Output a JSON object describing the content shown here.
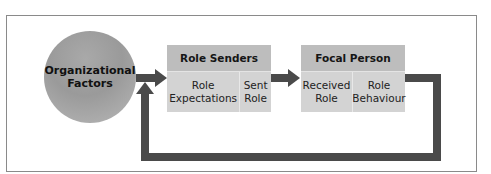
{
  "diagram": {
    "circle": {
      "label": "Organizational\nFactors",
      "color": "#a0a0a0"
    },
    "role_senders": {
      "title": "Role Senders",
      "cells": [
        {
          "label": "Role\nExpectations"
        },
        {
          "label": "Sent\nRole"
        }
      ]
    },
    "focal_person": {
      "title": "Focal Person",
      "cells": [
        {
          "label": "Received\nRole"
        },
        {
          "label": "Role\nBehaviour"
        }
      ]
    },
    "colors": {
      "arrow": "#4a4a4a",
      "header": "#bdbdbd",
      "cell": "#d3d3d3",
      "frame": "#8a8a8a"
    },
    "edges": [
      {
        "from": "Organizational Factors",
        "to": "Role Senders"
      },
      {
        "from": "Role Senders",
        "to": "Focal Person"
      },
      {
        "from": "Focal Person",
        "to": "Organizational Factors",
        "type": "feedback"
      }
    ]
  }
}
